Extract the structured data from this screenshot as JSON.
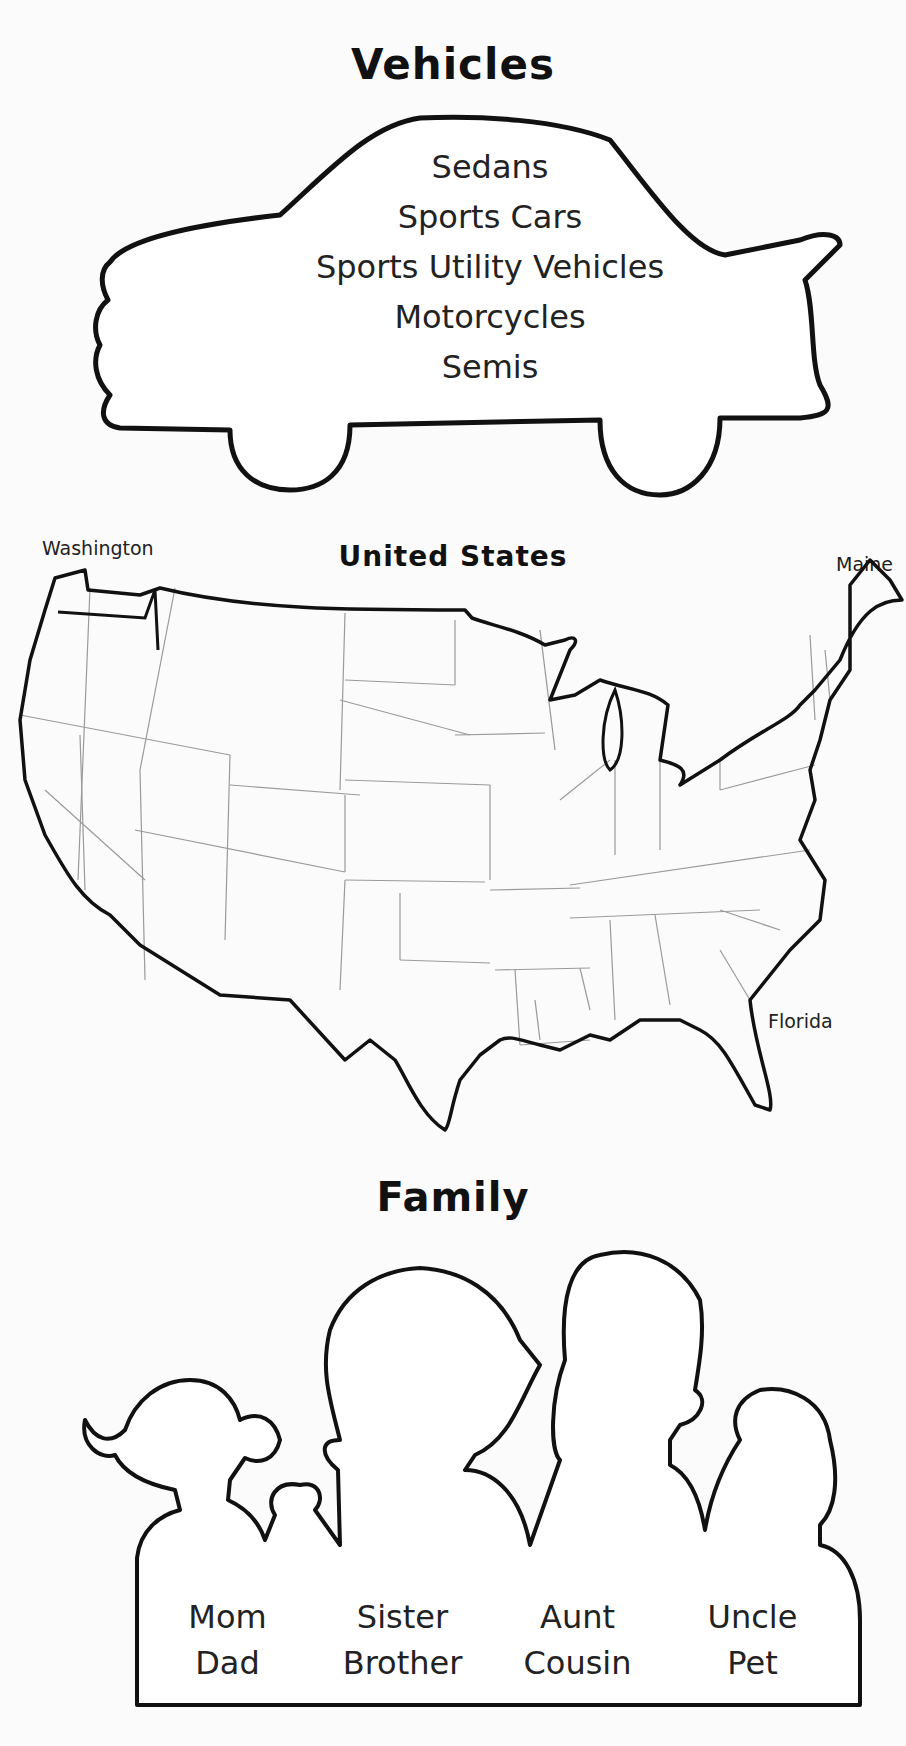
{
  "vehicles": {
    "title": "Vehicles",
    "items": [
      "Sedans",
      "Sports Cars",
      "Sports Utility Vehicles",
      "Motorcycles",
      "Semis"
    ]
  },
  "map": {
    "title": "United States",
    "labels": {
      "washington": "Washington",
      "maine": "Maine",
      "florida": "Florida"
    }
  },
  "family": {
    "title": "Family",
    "columns": [
      [
        "Mom",
        "Dad"
      ],
      [
        "Sister",
        "Brother"
      ],
      [
        "Aunt",
        "Cousin"
      ],
      [
        "Uncle",
        "Pet"
      ]
    ]
  },
  "colors": {
    "ink": "#111111",
    "paper": "#fbfbfb",
    "state_lines": "#9a9a9a"
  }
}
